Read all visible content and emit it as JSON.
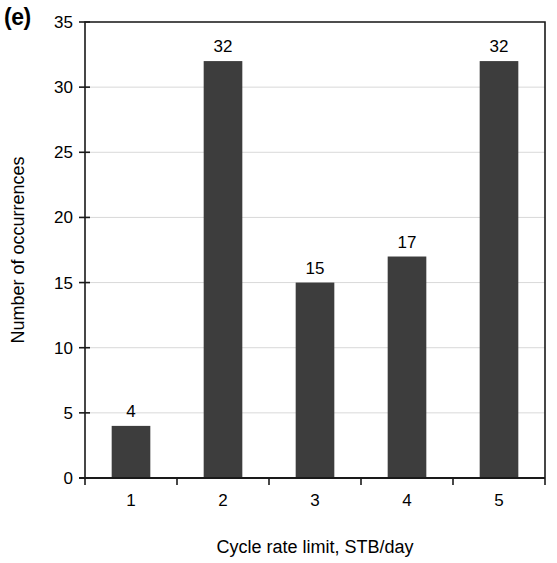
{
  "panel": {
    "label": "(e)"
  },
  "chart_data": {
    "type": "bar",
    "title": "",
    "subtitle": "",
    "panel_label": "(e)",
    "categories": [
      "1",
      "2",
      "3",
      "4",
      "5"
    ],
    "values": [
      4,
      32,
      15,
      17,
      32
    ],
    "data_labels": [
      "4",
      "32",
      "15",
      "17",
      "32"
    ],
    "xlabel": "Cycle rate limit, STB/day",
    "ylabel": "Number of occurrences",
    "ylim": [
      0,
      35
    ],
    "ytick_labels": [
      "0",
      "5",
      "10",
      "15",
      "20",
      "25",
      "30",
      "35"
    ],
    "ytick_values": [
      0,
      5,
      10,
      15,
      20,
      25,
      30,
      35
    ],
    "grid": "horizontal",
    "legend": "none",
    "bar_color": "#3d3d3d",
    "grid_color": "#d9d9d9",
    "axis_color": "#1a1a1a",
    "background_color": "#ffffff"
  },
  "plot_geometry": {
    "left": 85,
    "right": 545,
    "top": 22,
    "bottom": 478
  }
}
